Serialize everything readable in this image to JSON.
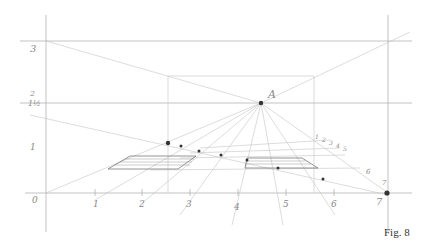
{
  "figure": {
    "caption": "Fig. 8",
    "vanishing_point_label": "A",
    "left_axis_labels": {
      "top": "3",
      "mid_a": "2",
      "mid_b": "1½",
      "low": "1",
      "base": "0"
    },
    "baseline_labels": [
      "1",
      "2",
      "3",
      "4",
      "5",
      "6",
      "7"
    ],
    "depth_labels": [
      "1",
      "2",
      "3",
      "4",
      "5",
      "6",
      "7"
    ],
    "colors": {
      "pencil": "#a9a9a9",
      "point": "#333333",
      "label": "#888888"
    }
  }
}
